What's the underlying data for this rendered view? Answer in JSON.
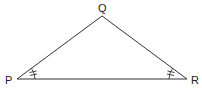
{
  "diagram": {
    "type": "triangle",
    "vertices": {
      "P": {
        "label": "P",
        "x": 17,
        "y": 79
      },
      "Q": {
        "label": "Q",
        "x": 102,
        "y": 16
      },
      "R": {
        "label": "R",
        "x": 187,
        "y": 79
      }
    },
    "labels": {
      "P": "P",
      "Q": "Q",
      "R": "R"
    },
    "angle_marks": [
      {
        "vertex": "P",
        "ticks": 2
      },
      {
        "vertex": "R",
        "ticks": 2
      }
    ],
    "stroke_color": "#333333"
  }
}
